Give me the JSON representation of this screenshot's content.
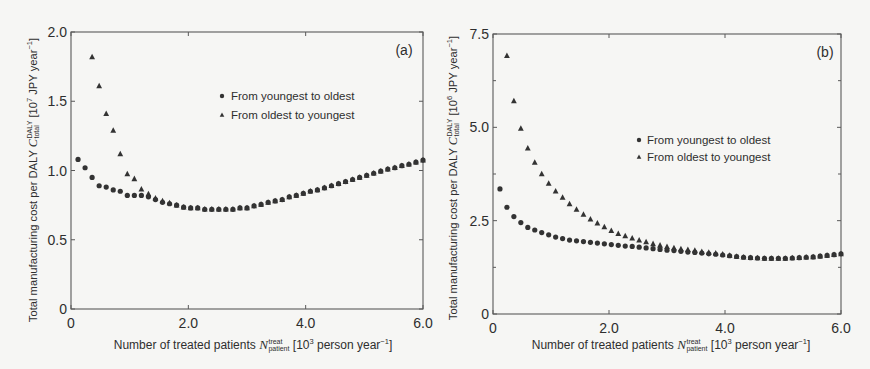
{
  "style": {
    "background": "#f6f6f4",
    "marker_color": "#333333",
    "axis_color": "#5a5a5a",
    "text_color": "#2e2e2e"
  },
  "chart_data": [
    {
      "type": "scatter",
      "panel_label": "(a)",
      "title": "",
      "xlabel": "Number of treated patients N_patient^treat [10^3 person year^-1]",
      "ylabel": "Total manufacturing cost per DALY C_total^DALY [10^7 JPY year^-1]",
      "xlabel_parts": {
        "text": "Number of treated patients ",
        "symbol": "N",
        "symbol_sup": "treat",
        "symbol_sub": "patient",
        "unit_pre": " [10",
        "unit_exp": "3",
        "unit_mid": " person year",
        "unit_exp2": "−1",
        "unit_post": "]"
      },
      "ylabel_parts": {
        "text": "Total manufacturing cost per DALY ",
        "symbol": "C",
        "symbol_sup": "DALY",
        "symbol_sub": "total",
        "unit_pre": " [10",
        "unit_exp": "7",
        "unit_mid": " JPY year",
        "unit_exp2": "−1",
        "unit_post": "]"
      },
      "xlim": [
        0,
        6.0
      ],
      "ylim": [
        0,
        2.0
      ],
      "xticks": [
        0,
        2.0,
        4.0,
        6.0
      ],
      "xtick_labels": [
        "0",
        "2.0",
        "4.0",
        "6.0"
      ],
      "yticks": [
        0,
        0.5,
        1.0,
        1.5,
        2.0
      ],
      "ytick_labels": [
        "0",
        "0.5",
        "1.0",
        "1.5",
        "2.0"
      ],
      "yminor_ticks": [],
      "grid": false,
      "legend": {
        "position": "upper right, inside plot",
        "entries": [
          {
            "label": "From youngest to oldest",
            "marker": "circle"
          },
          {
            "label": "From oldest to youngest",
            "marker": "triangle"
          }
        ]
      },
      "x": [
        0.12,
        0.24,
        0.36,
        0.48,
        0.6,
        0.72,
        0.84,
        0.96,
        1.08,
        1.2,
        1.32,
        1.44,
        1.56,
        1.68,
        1.8,
        1.92,
        2.04,
        2.16,
        2.28,
        2.4,
        2.52,
        2.64,
        2.76,
        2.88,
        3.0,
        3.12,
        3.24,
        3.36,
        3.48,
        3.6,
        3.72,
        3.84,
        3.96,
        4.08,
        4.2,
        4.32,
        4.44,
        4.56,
        4.68,
        4.8,
        4.92,
        5.04,
        5.16,
        5.28,
        5.4,
        5.52,
        5.64,
        5.76,
        5.88,
        6.0
      ],
      "series": [
        {
          "name": "From youngest to oldest",
          "marker": "circle",
          "y": [
            1.08,
            1.02,
            0.95,
            0.89,
            0.88,
            0.86,
            0.85,
            0.82,
            0.82,
            0.82,
            0.81,
            0.79,
            0.77,
            0.76,
            0.75,
            0.735,
            0.73,
            0.73,
            0.72,
            0.72,
            0.72,
            0.72,
            0.72,
            0.73,
            0.73,
            0.745,
            0.755,
            0.77,
            0.78,
            0.79,
            0.81,
            0.82,
            0.835,
            0.85,
            0.86,
            0.875,
            0.89,
            0.905,
            0.92,
            0.935,
            0.95,
            0.965,
            0.98,
            0.995,
            1.01,
            1.02,
            1.035,
            1.045,
            1.06,
            1.075
          ]
        },
        {
          "name": "From oldest to youngest",
          "marker": "triangle",
          "y": [
            null,
            null,
            1.82,
            1.61,
            1.41,
            1.29,
            1.12,
            0.975,
            0.94,
            0.865,
            0.83,
            0.8,
            0.78,
            0.765,
            0.75,
            0.735,
            0.73,
            0.73,
            0.72,
            0.72,
            0.72,
            0.72,
            0.72,
            0.73,
            0.73,
            0.745,
            0.755,
            0.77,
            0.78,
            0.79,
            0.81,
            0.82,
            0.835,
            0.85,
            0.86,
            0.875,
            0.89,
            0.905,
            0.92,
            0.935,
            0.95,
            0.965,
            0.98,
            0.995,
            1.01,
            1.02,
            1.035,
            1.045,
            1.06,
            1.075
          ]
        }
      ]
    },
    {
      "type": "scatter",
      "panel_label": "(b)",
      "title": "",
      "xlabel": "Number of treated patients N_patient^treat [10^3 person year^-1]",
      "ylabel": "Total manufacturing cost per DALY C_total^DALY [10^6 JPY year^-1]",
      "xlabel_parts": {
        "text": "Number of treated patients ",
        "symbol": "N",
        "symbol_sup": "treat",
        "symbol_sub": "patient",
        "unit_pre": " [10",
        "unit_exp": "3",
        "unit_mid": " person year",
        "unit_exp2": "−1",
        "unit_post": "]"
      },
      "ylabel_parts": {
        "text": "Total manufacturing cost per DALY ",
        "symbol": "C",
        "symbol_sup": "DALY",
        "symbol_sub": "total",
        "unit_pre": " [10",
        "unit_exp": "6",
        "unit_mid": " JPY year",
        "unit_exp2": "−1",
        "unit_post": "]"
      },
      "xlim": [
        0,
        6.0
      ],
      "ylim": [
        0,
        7.5
      ],
      "xticks": [
        0,
        2.0,
        4.0,
        6.0
      ],
      "xtick_labels": [
        "0",
        "2.0",
        "4.0",
        "6.0"
      ],
      "yticks": [
        0,
        2.5,
        5.0,
        7.5
      ],
      "ytick_labels": [
        "0",
        "2.5",
        "5.0",
        "7.5"
      ],
      "yminor_ticks": [
        1.25,
        3.75,
        6.25
      ],
      "grid": false,
      "legend": {
        "position": "center right, inside plot",
        "entries": [
          {
            "label": "From youngest to oldest",
            "marker": "circle"
          },
          {
            "label": "From oldest to youngest",
            "marker": "triangle"
          }
        ]
      },
      "x": [
        0.12,
        0.24,
        0.36,
        0.48,
        0.6,
        0.72,
        0.84,
        0.96,
        1.08,
        1.2,
        1.32,
        1.44,
        1.56,
        1.68,
        1.8,
        1.92,
        2.04,
        2.16,
        2.28,
        2.4,
        2.52,
        2.64,
        2.76,
        2.88,
        3.0,
        3.12,
        3.24,
        3.36,
        3.48,
        3.6,
        3.72,
        3.84,
        3.96,
        4.08,
        4.2,
        4.32,
        4.44,
        4.56,
        4.68,
        4.8,
        4.92,
        5.04,
        5.16,
        5.28,
        5.4,
        5.52,
        5.64,
        5.76,
        5.88,
        6.0
      ],
      "series": [
        {
          "name": "From youngest to oldest",
          "marker": "circle",
          "y": [
            3.35,
            2.86,
            2.61,
            2.45,
            2.32,
            2.25,
            2.18,
            2.12,
            2.06,
            2.02,
            1.98,
            1.96,
            1.94,
            1.92,
            1.9,
            1.88,
            1.86,
            1.84,
            1.82,
            1.81,
            1.79,
            1.77,
            1.75,
            1.73,
            1.71,
            1.7,
            1.68,
            1.66,
            1.65,
            1.63,
            1.61,
            1.6,
            1.58,
            1.56,
            1.54,
            1.52,
            1.51,
            1.5,
            1.49,
            1.49,
            1.49,
            1.49,
            1.5,
            1.51,
            1.52,
            1.53,
            1.55,
            1.57,
            1.59,
            1.61
          ]
        },
        {
          "name": "From oldest to youngest",
          "marker": "triangle",
          "y": [
            null,
            6.92,
            5.71,
            4.97,
            4.44,
            4.06,
            3.75,
            3.5,
            3.29,
            3.12,
            2.95,
            2.8,
            2.67,
            2.54,
            2.43,
            2.33,
            2.23,
            2.15,
            2.09,
            2.03,
            1.98,
            1.93,
            1.88,
            1.84,
            1.8,
            1.77,
            1.74,
            1.72,
            1.7,
            1.67,
            1.65,
            1.63,
            1.6,
            1.57,
            1.54,
            1.52,
            1.51,
            1.5,
            1.49,
            1.49,
            1.49,
            1.49,
            1.5,
            1.51,
            1.52,
            1.53,
            1.55,
            1.57,
            1.59,
            1.61
          ]
        }
      ]
    }
  ]
}
